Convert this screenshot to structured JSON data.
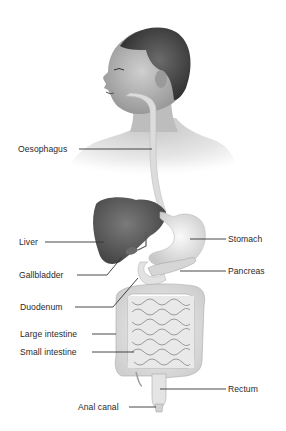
{
  "diagram": {
    "colors": {
      "background": "#ffffff",
      "skin": "#b9b9b9",
      "hair": "#3c3c3c",
      "liver": "#555555",
      "organ_light": "#e6e6e6",
      "leader_line": "#333333",
      "label_text": "#2a2a2a"
    },
    "labels": [
      {
        "id": "oesophagus",
        "text": "Oesophagus",
        "x": 18,
        "y": 144,
        "side": "left"
      },
      {
        "id": "liver",
        "text": "Liver",
        "x": 19,
        "y": 237,
        "side": "left"
      },
      {
        "id": "stomach",
        "text": "Stomach",
        "x": 228,
        "y": 235,
        "side": "right"
      },
      {
        "id": "gallbladder",
        "text": "Gallbladder",
        "x": 19,
        "y": 268,
        "side": "left"
      },
      {
        "id": "pancreas",
        "text": "Pancreas",
        "x": 228,
        "y": 267,
        "side": "right"
      },
      {
        "id": "duodenum",
        "text": "Duodenum",
        "x": 20,
        "y": 300,
        "side": "left"
      },
      {
        "id": "large_intestine",
        "text": "Large intestine",
        "x": 20,
        "y": 327,
        "side": "left"
      },
      {
        "id": "small_intestine",
        "text": "Small intestine",
        "x": 20,
        "y": 345,
        "side": "left"
      },
      {
        "id": "rectum",
        "text": "Rectum",
        "x": 228,
        "y": 384,
        "side": "right"
      },
      {
        "id": "anal_canal",
        "text": "Anal canal",
        "x": 78,
        "y": 402,
        "side": "left"
      }
    ]
  }
}
